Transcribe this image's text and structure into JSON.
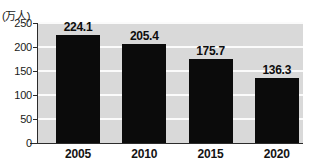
{
  "chart_data": {
    "type": "bar",
    "title": "",
    "subtitle": "",
    "xlabel": "",
    "ylabel": "(万人)",
    "unit_label": "(万人)",
    "categories": [
      "2005",
      "2010",
      "2015",
      "2020"
    ],
    "values": [
      224.1,
      205.4,
      175.7,
      136.3
    ],
    "value_labels": [
      "224.1",
      "205.4",
      "175.7",
      "136.3"
    ],
    "series": [
      {
        "name": "",
        "values": [
          224.1,
          205.4,
          175.7,
          136.3
        ]
      }
    ],
    "ylim": [
      0,
      250
    ],
    "yticks": [
      0,
      50,
      100,
      150,
      200,
      250
    ],
    "ytick_labels": [
      "0",
      "50",
      "100",
      "150",
      "200",
      "250"
    ],
    "grid": true,
    "grid_axis": "y",
    "legend": false,
    "legend_position": "none",
    "bar_color": "#0b0b0b",
    "plot_background": "#d9d9d9",
    "gridline_color": "#fbfbfb",
    "axis_color": "#2b2b2b",
    "figure_background": "#ffffff"
  }
}
